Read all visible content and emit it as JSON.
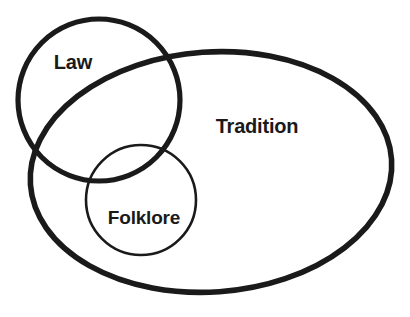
{
  "figure": {
    "type": "venn-diagram",
    "background_color": "#ffffff",
    "stroke_color": "#1a1a1a",
    "text_color": "#1a1a1a",
    "width": 410,
    "height": 317
  },
  "sets": [
    {
      "id": "law",
      "label": "Law",
      "shape": "circle",
      "cx": 99,
      "cy": 100,
      "r": 81,
      "rotation": 0,
      "stroke_width": 5.2,
      "label_x": 73,
      "label_y": 64,
      "label_size": 20
    },
    {
      "id": "tradition",
      "label": "Tradition",
      "shape": "ellipse",
      "cx": 211,
      "cy": 172,
      "rx": 181,
      "ry": 120,
      "rotation": -4,
      "stroke_width": 5.6,
      "label_x": 257,
      "label_y": 128,
      "label_size": 20
    },
    {
      "id": "folklore",
      "label": "Folklore",
      "shape": "circle",
      "cx": 141,
      "cy": 200,
      "r": 55,
      "rotation": 0,
      "stroke_width": 2.6,
      "label_x": 144,
      "label_y": 219,
      "label_size": 19
    }
  ],
  "chart_data": {
    "type": "venn",
    "title": "",
    "labels": [
      "Law",
      "Tradition",
      "Folklore"
    ],
    "relations": [
      "Law overlaps Tradition",
      "Folklore is contained within Tradition",
      "Folklore overlaps Law"
    ],
    "legend": "none",
    "grid": false
  }
}
